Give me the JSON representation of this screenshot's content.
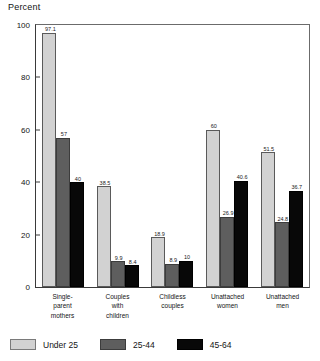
{
  "chart_data": {
    "type": "bar",
    "title": "",
    "ylabel": "Percent",
    "xlabel": "",
    "ylim": [
      0,
      100
    ],
    "yticks": [
      0,
      20,
      40,
      60,
      80,
      100
    ],
    "grid": false,
    "legend_position": "bottom",
    "categories": [
      "Single-\nparent\nmothers",
      "Couples\nwith\nchildren",
      "Childless\ncouples",
      "Unattached\nwomen",
      "Unattached\nmen"
    ],
    "series": [
      {
        "name": "Under 25",
        "color": "#d2d2d2",
        "values": [
          97.1,
          38.5,
          18.9,
          60,
          51.5
        ]
      },
      {
        "name": "25-44",
        "color": "#5e5e5e",
        "values": [
          57,
          9.9,
          8.9,
          26.9,
          24.8
        ]
      },
      {
        "name": "45-64",
        "color": "#080808",
        "values": [
          40,
          8.4,
          10,
          40.6,
          36.7
        ]
      }
    ],
    "value_labels": [
      [
        "97.1",
        "38.5",
        "18.9",
        "60",
        "51.5"
      ],
      [
        "57",
        "9.9",
        "8.9",
        "26.9",
        "24.8"
      ],
      [
        "40",
        "8.4",
        "10",
        "40.6",
        "36.7"
      ]
    ]
  }
}
